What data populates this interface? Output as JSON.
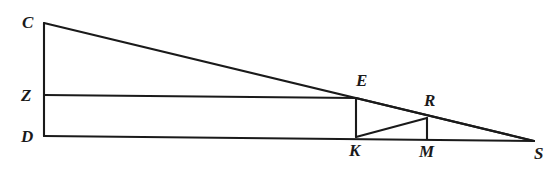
{
  "figure": {
    "type": "geometry-diagram",
    "background_color": "#ffffff",
    "stroke_color": "#1a1a1a",
    "label_color": "#1a1a1a",
    "width": 553,
    "height": 192,
    "points": {
      "C": {
        "x": 44,
        "y": 23
      },
      "Z": {
        "x": 44,
        "y": 95
      },
      "D": {
        "x": 44,
        "y": 136
      },
      "E": {
        "x": 356,
        "y": 98
      },
      "K": {
        "x": 356,
        "y": 137
      },
      "R": {
        "x": 427,
        "y": 118
      },
      "M": {
        "x": 427,
        "y": 139
      },
      "S": {
        "x": 534,
        "y": 141
      }
    },
    "segments": [
      {
        "name": "C-D",
        "from": "C",
        "to": "D",
        "role": "left-vertical-leg"
      },
      {
        "name": "C-S",
        "from": "C",
        "to": "S",
        "role": "outer-hypotenuse"
      },
      {
        "name": "D-S",
        "from": "D",
        "to": "S",
        "role": "baseline"
      },
      {
        "name": "Z-E",
        "from": "Z",
        "to": "E",
        "role": "mid-horizontal"
      },
      {
        "name": "E-K",
        "from": "E",
        "to": "K",
        "role": "vertical-at-K"
      },
      {
        "name": "E-S",
        "from": "E",
        "to": "S",
        "role": "inner-hypotenuse"
      },
      {
        "name": "K-R",
        "from": "K",
        "to": "R",
        "role": "inner-hypotenuse-small"
      },
      {
        "name": "R-M",
        "from": "R",
        "to": "M",
        "role": "vertical-at-M"
      }
    ],
    "labels": [
      {
        "id": "C",
        "text": "C",
        "x": 22,
        "y": 14,
        "name": "vertex-label-c"
      },
      {
        "id": "Z",
        "text": "Z",
        "x": 21,
        "y": 87,
        "name": "vertex-label-z"
      },
      {
        "id": "D",
        "text": "D",
        "x": 21,
        "y": 128,
        "name": "vertex-label-d"
      },
      {
        "id": "E",
        "text": "E",
        "x": 356,
        "y": 72,
        "name": "vertex-label-e"
      },
      {
        "id": "R",
        "text": "R",
        "x": 424,
        "y": 92,
        "name": "vertex-label-r"
      },
      {
        "id": "K",
        "text": "K",
        "x": 349,
        "y": 142,
        "name": "vertex-label-k"
      },
      {
        "id": "M",
        "text": "M",
        "x": 419,
        "y": 143,
        "name": "vertex-label-m"
      },
      {
        "id": "S",
        "text": "S",
        "x": 534,
        "y": 145,
        "name": "vertex-label-s"
      }
    ]
  }
}
